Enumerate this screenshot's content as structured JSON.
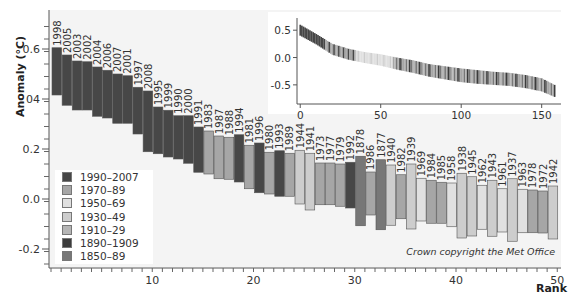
{
  "chart_data": [
    {
      "type": "bar",
      "title": "",
      "xlabel": "Rank",
      "ylabel": "Anomaly (°C)",
      "ylim": [
        -0.27,
        0.75
      ],
      "xlim": [
        0,
        50
      ],
      "y_ticks": [
        "-0.2",
        "0.0",
        "0.2",
        "04",
        "0.6"
      ],
      "y_tick_values": [
        -0.2,
        0.0,
        0.2,
        0.4,
        0.6
      ],
      "x_ticks": [
        "10",
        "20",
        "30",
        "40",
        "50"
      ],
      "x_tick_values": [
        10,
        20,
        30,
        40,
        50
      ],
      "grid": false,
      "legend_position": "lower left",
      "annotation": "Crown copyright the Met Office",
      "legend": [
        {
          "label": "1990–2007",
          "color": "#474747"
        },
        {
          "label": "1970–89",
          "color": "#a6a6a6"
        },
        {
          "label": "1950–69",
          "color": "#e0e0e0"
        },
        {
          "label": "1930–49",
          "color": "#cdcdcd"
        },
        {
          "label": "1910–29",
          "color": "#b5b5b5"
        },
        {
          "label": "1890–1909",
          "color": "#3c3c3c"
        },
        {
          "label": "1850–89",
          "color": "#777777"
        }
      ],
      "categories": [
        "1998",
        "2005",
        "2003",
        "2002",
        "2004",
        "2006",
        "2007",
        "2001",
        "1997",
        "2008",
        "1995",
        "1999",
        "1990",
        "2000",
        "1991",
        "1983",
        "1987",
        "1988",
        "1994",
        "1981",
        "1996",
        "1980",
        "1993",
        "1989",
        "1944",
        "1941",
        "1973",
        "1977",
        "1979",
        "1992",
        "1878",
        "1986",
        "1877",
        "1940",
        "1982",
        "1939",
        "1969",
        "1984",
        "1985",
        "1958",
        "1938",
        "1945",
        "1962",
        "1943",
        "1961",
        "1937",
        "1963",
        "1978",
        "1972",
        "1942"
      ],
      "series": [
        {
          "name": "anomaly_upper",
          "values": [
            0.605,
            0.576,
            0.552,
            0.549,
            0.528,
            0.515,
            0.5,
            0.493,
            0.447,
            0.432,
            0.368,
            0.355,
            0.333,
            0.333,
            0.288,
            0.272,
            0.252,
            0.247,
            0.257,
            0.215,
            0.224,
            0.187,
            0.193,
            0.183,
            0.195,
            0.183,
            0.144,
            0.144,
            0.14,
            0.147,
            0.171,
            0.108,
            0.157,
            0.136,
            0.097,
            0.14,
            0.083,
            0.075,
            0.067,
            0.064,
            0.103,
            0.089,
            0.055,
            0.075,
            0.041,
            0.081,
            0.039,
            0.036,
            0.032,
            0.052
          ]
        },
        {
          "name": "anomaly_lower",
          "values": [
            0.416,
            0.375,
            0.356,
            0.356,
            0.331,
            0.324,
            0.303,
            0.303,
            0.26,
            0.189,
            0.181,
            0.168,
            0.16,
            0.143,
            0.107,
            0.1,
            0.081,
            0.079,
            0.068,
            0.041,
            0.025,
            0.02,
            0.011,
            0.011,
            -0.02,
            -0.044,
            -0.023,
            -0.023,
            -0.029,
            -0.036,
            -0.107,
            -0.064,
            -0.123,
            -0.105,
            -0.079,
            -0.12,
            -0.088,
            -0.097,
            -0.097,
            -0.111,
            -0.156,
            -0.148,
            -0.121,
            -0.149,
            -0.132,
            -0.169,
            -0.135,
            -0.135,
            -0.136,
            -0.16
          ]
        },
        {
          "name": "period",
          "values": [
            "1990–2007",
            "1990–2007",
            "1990–2007",
            "1990–2007",
            "1990–2007",
            "1990–2007",
            "1990–2007",
            "1990–2007",
            "1990–2007",
            "1990–2007",
            "1990–2007",
            "1990–2007",
            "1990–2007",
            "1990–2007",
            "1990–2007",
            "1970–89",
            "1970–89",
            "1970–89",
            "1990–2007",
            "1970–89",
            "1990–2007",
            "1970–89",
            "1990–2007",
            "1970–89",
            "1930–49",
            "1930–49",
            "1970–89",
            "1970–89",
            "1970–89",
            "1990–2007",
            "1850–89",
            "1970–89",
            "1850–89",
            "1930–49",
            "1970–89",
            "1930–49",
            "1950–69",
            "1970–89",
            "1970–89",
            "1950–69",
            "1930–49",
            "1930–49",
            "1950–69",
            "1930–49",
            "1950–69",
            "1930–49",
            "1950–69",
            "1970–89",
            "1970–89",
            "1930–49"
          ]
        }
      ]
    },
    {
      "type": "bar",
      "title": "inset: all years ranked",
      "xlabel": "",
      "ylabel": "",
      "x_ticks": [
        "0",
        "50",
        "100",
        "150"
      ],
      "x_tick_values": [
        0,
        50,
        100,
        150
      ],
      "y_ticks": [
        "0.5",
        "0.0",
        "-0.5"
      ],
      "y_tick_values": [
        0.5,
        0.0,
        -0.5
      ],
      "xlim": [
        -2,
        162
      ],
      "ylim": [
        -0.85,
        0.65
      ],
      "trend": {
        "x": [
          0,
          10,
          20,
          30,
          40,
          50,
          60,
          70,
          80,
          90,
          100,
          110,
          120,
          130,
          140,
          150,
          158
        ],
        "upper": [
          0.6,
          0.43,
          0.25,
          0.16,
          0.1,
          0.06,
          0.0,
          -0.05,
          -0.12,
          -0.16,
          -0.2,
          -0.23,
          -0.26,
          -0.28,
          -0.32,
          -0.38,
          -0.5
        ],
        "lower": [
          0.4,
          0.24,
          0.05,
          -0.04,
          -0.1,
          -0.15,
          -0.22,
          -0.28,
          -0.35,
          -0.4,
          -0.45,
          -0.48,
          -0.5,
          -0.52,
          -0.56,
          -0.62,
          -0.72
        ]
      }
    }
  ],
  "labels": {
    "ylabel": "Anomaly (°C)",
    "xlabel": "Rank",
    "copyright": "Crown copyright the Met Office"
  }
}
